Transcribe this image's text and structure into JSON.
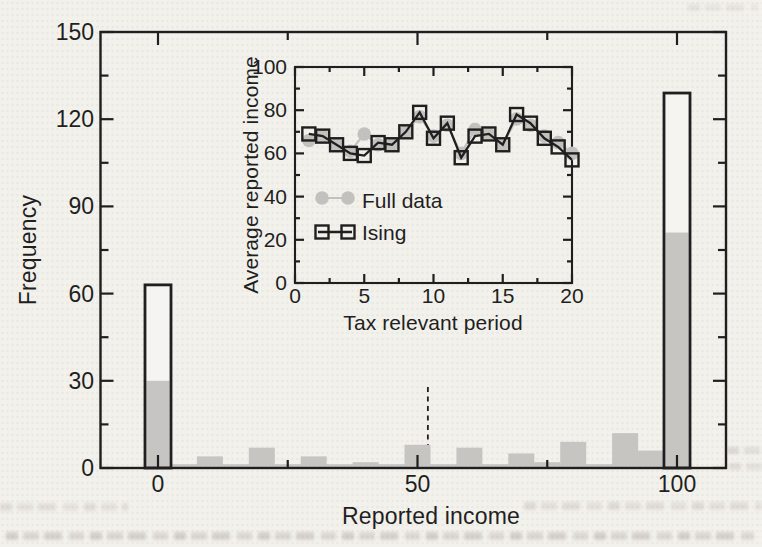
{
  "figure": {
    "paper": "#f3f1ec",
    "ink": "#1f1f1f",
    "bar_gray": "#c6c5c2",
    "marker_gray": "#c2c1be",
    "open_bar_fill": "#f6f4f0"
  },
  "chart_data": [
    {
      "id": "main-histogram",
      "type": "bar",
      "xlabel": "Reported income",
      "ylabel": "Frequency",
      "xlim": [
        -11,
        109.5
      ],
      "ylim": [
        0,
        150
      ],
      "xticks": [
        0,
        50,
        100
      ],
      "xminorticks": [
        25,
        75
      ],
      "yticks": [
        0,
        30,
        60,
        90,
        120,
        150
      ],
      "yminorticks": [
        15,
        45,
        75,
        105,
        135
      ],
      "grid": false,
      "bin_width": 5,
      "outline_bars": {
        "categories": [
          0,
          100
        ],
        "values": [
          63,
          129
        ]
      },
      "gray_bars": {
        "categories": [
          0,
          5,
          10,
          15,
          20,
          25,
          30,
          35,
          40,
          45,
          50,
          55,
          60,
          65,
          70,
          75,
          80,
          85,
          90,
          95,
          100
        ],
        "values": [
          30,
          1,
          4,
          1,
          7,
          1,
          4,
          1,
          2,
          1,
          8,
          1,
          7,
          1,
          5,
          2,
          9,
          1,
          12,
          6,
          81
        ]
      },
      "baseline_strip": {
        "from": 2.5,
        "to": 97.5,
        "height": 1.3
      },
      "dashed_line": {
        "x": 52,
        "y_top": 29
      }
    },
    {
      "id": "inset-average-income",
      "type": "line",
      "xlabel": "Tax relevant period",
      "ylabel": "Average reported income",
      "xlim": [
        0,
        20
      ],
      "ylim": [
        0,
        100
      ],
      "xticks": [
        0,
        5,
        10,
        15,
        20
      ],
      "xminorticks": [
        2.5,
        7.5,
        12.5,
        17.5
      ],
      "yticks": [
        0,
        20,
        40,
        60,
        80,
        100
      ],
      "yminorticks": [
        10,
        30,
        50,
        70,
        90
      ],
      "grid": false,
      "legend_position": "inside-left-middle",
      "x": [
        1,
        2,
        3,
        4,
        5,
        6,
        7,
        8,
        9,
        10,
        11,
        12,
        13,
        14,
        15,
        16,
        17,
        18,
        19,
        20
      ],
      "series": [
        {
          "name": "Full data",
          "marker": "filled-circle",
          "color": "#c2c1be",
          "values": [
            66,
            68,
            64,
            61,
            69,
            64,
            64,
            70,
            77,
            68,
            73,
            60,
            71,
            69,
            64,
            76,
            73,
            68,
            65,
            60
          ]
        },
        {
          "name": "Ising",
          "marker": "open-square",
          "color": "#1f1f1f",
          "values": [
            69,
            68,
            64,
            60,
            59,
            65,
            64,
            70,
            79,
            67,
            74,
            58,
            68,
            69,
            64,
            78,
            74,
            67,
            63,
            57
          ]
        }
      ]
    }
  ]
}
